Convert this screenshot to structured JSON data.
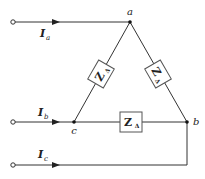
{
  "diagram": {
    "title": "",
    "nodes": {
      "a": {
        "label": "a"
      },
      "b": {
        "label": "b"
      },
      "c": {
        "label": "c"
      }
    },
    "currents": [
      {
        "name": "I",
        "subscript": "a"
      },
      {
        "name": "I",
        "subscript": "b"
      },
      {
        "name": "I",
        "subscript": "c"
      }
    ],
    "impedances": [
      {
        "name": "Z",
        "subscript": "Δ",
        "between": "a-c"
      },
      {
        "name": "Z",
        "subscript": "Δ",
        "between": "a-b"
      },
      {
        "name": "Z",
        "subscript": "Δ",
        "between": "c-b"
      }
    ],
    "colors": {
      "stroke": "#333333",
      "box_fill": "#ffffff"
    }
  }
}
